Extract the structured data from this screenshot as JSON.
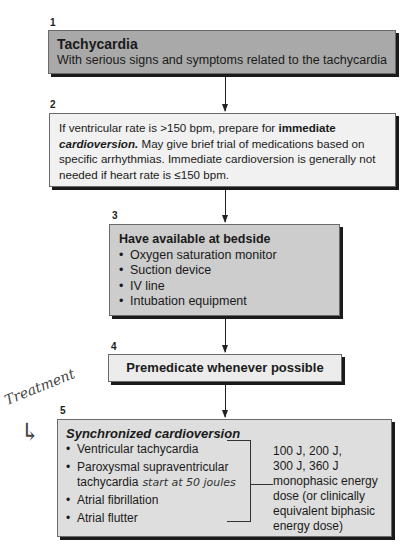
{
  "steps": [
    {
      "number": "1",
      "title": "Tachycardia",
      "subtitle": "With serious signs and symptoms related to the tachycardia"
    },
    {
      "number": "2",
      "text_pre": "If ventricular rate is >150 bpm, prepare for ",
      "text_bold": "immediate",
      "text_bold_italic": "cardioversion.",
      "text_post": " May give brief trial of medications based on specific arrhythmias. Immediate cardioversion is generally not needed if heart rate is ≤150 bpm."
    },
    {
      "number": "3",
      "title": "Have available at bedside",
      "items": [
        "Oxygen saturation monitor",
        "Suction device",
        "IV line",
        "Intubation equipment"
      ]
    },
    {
      "number": "4",
      "title": "Premedicate whenever possible"
    },
    {
      "number": "5",
      "title": "Synchronized cardioversion",
      "items": [
        "Ventricular tachycardia",
        "Paroxysmal supraventricular",
        "tachycardia",
        "Atrial fibrillation",
        "Atrial flutter"
      ],
      "handwritten_note": "start at 50 joules",
      "energy_lines": [
        "100 J, 200 J,",
        "300 J, 360 J",
        "monophasic energy",
        "dose (or clinically",
        "equivalent biphasic",
        "energy dose)"
      ]
    }
  ],
  "annotations": {
    "margin_note": "Treatment",
    "arrow_glyph": "↳"
  },
  "colors": {
    "box1": "#a9a9a9",
    "box2": "#f1f1f1",
    "box3": "#cdcdcd",
    "box4": "#ececec",
    "box5": "#dedede",
    "shadow": "#1a1a1a"
  }
}
